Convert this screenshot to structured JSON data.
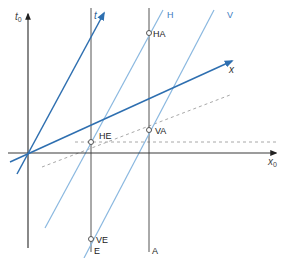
{
  "diagram": {
    "colors": {
      "axis_rest": "#3a3a3a",
      "axis_moving": "#2e6fb0",
      "worldline_light": "#8ab8e0",
      "label_blue": "#3d7cc0",
      "label_dark": "#222222",
      "dashed": "#a8a8a8"
    },
    "axes": {
      "t0_label": "t",
      "t0_sub": "0",
      "x0_label": "x",
      "x0_sub": "0",
      "t_label": "t",
      "x_label": "x"
    },
    "worldlines": {
      "H_label": "H",
      "V_label": "V",
      "E_label": "E",
      "A_label": "A"
    },
    "events": [
      {
        "id": "HA",
        "label": "HA"
      },
      {
        "id": "HE",
        "label": "HE"
      },
      {
        "id": "VA",
        "label": "VA"
      },
      {
        "id": "VE",
        "label": "VE"
      }
    ]
  }
}
